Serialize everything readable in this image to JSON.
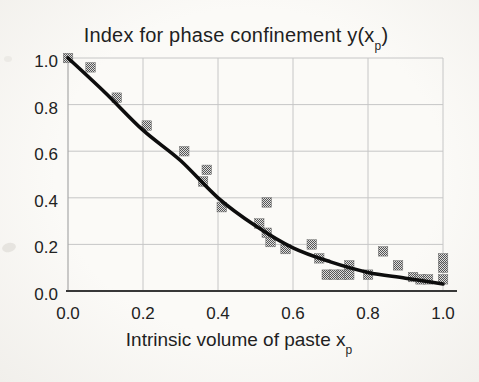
{
  "labels": {
    "title": {
      "pre": "Index for phase confinement y(x",
      "sub": "p",
      "post": ")"
    },
    "xlabel": {
      "pre": "Intrinsic volume of paste x",
      "sub": "p",
      "post": ""
    }
  },
  "chart_data": {
    "type": "scatter",
    "xlabel": "Intrinsic volume of paste x_p",
    "ylabel": "",
    "xlim": [
      0.0,
      1.0
    ],
    "ylim": [
      0.0,
      1.0
    ],
    "grid": true,
    "legend": "none",
    "xticks": {
      "values": [
        0.0,
        0.2,
        0.4,
        0.6,
        0.8,
        1.0
      ],
      "labels": [
        "0.0",
        "0.2",
        "0.4",
        "0.6",
        "0.8",
        "1.0"
      ]
    },
    "yticks": {
      "values": [
        0.0,
        0.2,
        0.4,
        0.6,
        0.8,
        1.0
      ],
      "labels": [
        "0.0",
        "0.2",
        "0.4",
        "0.6",
        "0.8",
        "1.0"
      ]
    },
    "colors": {
      "background": "#f7f5f1",
      "grid": "#c6c6c6",
      "left_axis": "#a8a8a8",
      "bottom_axis": "#383838",
      "text": "#222222",
      "marker": "#8c8c8c",
      "curve": "#0d0d0d"
    },
    "series": [
      {
        "name": "measured-points",
        "type": "scatter",
        "marker": "square",
        "marker_size": 9.5,
        "color": "#8c8c8c",
        "points": [
          [
            0.0,
            1.0
          ],
          [
            0.06,
            0.96
          ],
          [
            0.13,
            0.83
          ],
          [
            0.21,
            0.71
          ],
          [
            0.31,
            0.6
          ],
          [
            0.36,
            0.47
          ],
          [
            0.37,
            0.52
          ],
          [
            0.41,
            0.36
          ],
          [
            0.51,
            0.29
          ],
          [
            0.53,
            0.38
          ],
          [
            0.53,
            0.25
          ],
          [
            0.54,
            0.21
          ],
          [
            0.58,
            0.18
          ],
          [
            0.65,
            0.2
          ],
          [
            0.67,
            0.14
          ],
          [
            0.69,
            0.07
          ],
          [
            0.71,
            0.07
          ],
          [
            0.73,
            0.07
          ],
          [
            0.75,
            0.11
          ],
          [
            0.75,
            0.07
          ],
          [
            0.8,
            0.07
          ],
          [
            0.84,
            0.17
          ],
          [
            0.88,
            0.11
          ],
          [
            0.92,
            0.06
          ],
          [
            0.94,
            0.05
          ],
          [
            0.96,
            0.05
          ],
          [
            1.0,
            0.14
          ],
          [
            1.0,
            0.1
          ],
          [
            1.0,
            0.05
          ]
        ]
      },
      {
        "name": "fitted-curve",
        "type": "line",
        "color": "#0d0d0d",
        "width": 3.6,
        "points": [
          [
            0.0,
            1.0
          ],
          [
            0.1,
            0.85
          ],
          [
            0.2,
            0.69
          ],
          [
            0.3,
            0.56
          ],
          [
            0.4,
            0.4
          ],
          [
            0.5,
            0.28
          ],
          [
            0.6,
            0.185
          ],
          [
            0.7,
            0.125
          ],
          [
            0.8,
            0.08
          ],
          [
            0.9,
            0.055
          ],
          [
            1.0,
            0.03
          ]
        ]
      }
    ]
  }
}
